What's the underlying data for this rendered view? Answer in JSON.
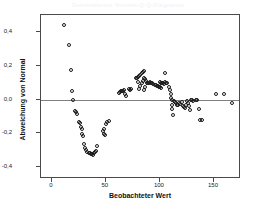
{
  "chart_data": {
    "type": "scatter",
    "title": "Detrendiertes Normal-Q-Q-Diagramm",
    "xlabel": "Beobachteter Wert",
    "ylabel": "Abweichung von Normal",
    "xlim": [
      -10,
      175
    ],
    "ylim": [
      -0.47,
      0.5
    ],
    "xticks": [
      0,
      50,
      100,
      150
    ],
    "xtick_labels": [
      "0",
      "50",
      "100",
      "150"
    ],
    "yticks": [
      0.4,
      0.2,
      0.0,
      -0.2,
      -0.4
    ],
    "ytick_labels": [
      "0,4",
      "0,2",
      "0,0",
      "-0,2",
      "-0,4"
    ],
    "grid": false,
    "legend": false,
    "reference_line_y": 0.0,
    "marker": "open-circle",
    "marker_color": "#1a1a1a",
    "reference_line_color": "#808080",
    "frame_color": "#4a4a4a",
    "points": [
      [
        11,
        0.44
      ],
      [
        16,
        0.32
      ],
      [
        18,
        0.175
      ],
      [
        19,
        0.05
      ],
      [
        20,
        -0.005
      ],
      [
        21,
        -0.065
      ],
      [
        22,
        -0.075
      ],
      [
        23,
        -0.085
      ],
      [
        25,
        -0.135
      ],
      [
        26,
        -0.14
      ],
      [
        27,
        -0.165
      ],
      [
        28,
        -0.175
      ],
      [
        28,
        -0.205
      ],
      [
        29,
        -0.215
      ],
      [
        30,
        -0.265
      ],
      [
        31,
        -0.285
      ],
      [
        32,
        -0.3
      ],
      [
        33,
        -0.31
      ],
      [
        34,
        -0.315
      ],
      [
        35,
        -0.315
      ],
      [
        36,
        -0.32
      ],
      [
        37,
        -0.325
      ],
      [
        38,
        -0.33
      ],
      [
        39,
        -0.315
      ],
      [
        40,
        -0.31
      ],
      [
        41,
        -0.305
      ],
      [
        42,
        -0.275
      ],
      [
        47,
        -0.185
      ],
      [
        48,
        -0.175
      ],
      [
        48,
        -0.205
      ],
      [
        49,
        -0.21
      ],
      [
        50,
        -0.145
      ],
      [
        51,
        -0.135
      ],
      [
        53,
        -0.125
      ],
      [
        62,
        0.04
      ],
      [
        63,
        0.045
      ],
      [
        64,
        0.048
      ],
      [
        65,
        0.05
      ],
      [
        66,
        0.052
      ],
      [
        67,
        0.055
      ],
      [
        68,
        0.035
      ],
      [
        69,
        0.02
      ],
      [
        71,
        0.06
      ],
      [
        72,
        0.058
      ],
      [
        73,
        0.062
      ],
      [
        78,
        0.13
      ],
      [
        79,
        0.125
      ],
      [
        80,
        0.135
      ],
      [
        80,
        0.105
      ],
      [
        81,
        0.14
      ],
      [
        81,
        0.06
      ],
      [
        82,
        0.145
      ],
      [
        82,
        0.08
      ],
      [
        83,
        0.155
      ],
      [
        83,
        0.095
      ],
      [
        84,
        0.165
      ],
      [
        84,
        0.11
      ],
      [
        85,
        0.17
      ],
      [
        85,
        0.13
      ],
      [
        85,
        0.055
      ],
      [
        86,
        0.12
      ],
      [
        86,
        0.075
      ],
      [
        87,
        0.11
      ],
      [
        88,
        0.1
      ],
      [
        89,
        0.095
      ],
      [
        90,
        0.1
      ],
      [
        91,
        0.105
      ],
      [
        92,
        0.1
      ],
      [
        93,
        0.095
      ],
      [
        94,
        0.09
      ],
      [
        95,
        0.088
      ],
      [
        96,
        0.085
      ],
      [
        97,
        0.082
      ],
      [
        98,
        0.078
      ],
      [
        99,
        0.075
      ],
      [
        100,
        0.105
      ],
      [
        100,
        0.072
      ],
      [
        101,
        0.1
      ],
      [
        101,
        0.07
      ],
      [
        102,
        0.098
      ],
      [
        103,
        0.095
      ],
      [
        104,
        0.09
      ],
      [
        105,
        0.155
      ],
      [
        105,
        0.105
      ],
      [
        106,
        0.1
      ],
      [
        107,
        0.095
      ],
      [
        108,
        0.075
      ],
      [
        109,
        0.055
      ],
      [
        110,
        0.03
      ],
      [
        110,
        0.01
      ],
      [
        111,
        -0.005
      ],
      [
        111,
        -0.03
      ],
      [
        111,
        -0.055
      ],
      [
        112,
        -0.09
      ],
      [
        113,
        -0.01
      ],
      [
        114,
        -0.015
      ],
      [
        115,
        -0.02
      ],
      [
        116,
        -0.035
      ],
      [
        117,
        -0.03
      ],
      [
        118,
        -0.02
      ],
      [
        119,
        -0.025
      ],
      [
        120,
        -0.015
      ],
      [
        121,
        -0.04
      ],
      [
        122,
        -0.045
      ],
      [
        123,
        -0.05
      ],
      [
        124,
        -0.035
      ],
      [
        125,
        -0.01
      ],
      [
        126,
        -0.02
      ],
      [
        127,
        -0.04
      ],
      [
        128,
        -0.06
      ],
      [
        129,
        -0.005
      ],
      [
        130,
        -0.005
      ],
      [
        131,
        -0.01
      ],
      [
        133,
        -0.005
      ],
      [
        134,
        0.0
      ],
      [
        136,
        -0.055
      ],
      [
        137,
        -0.12
      ],
      [
        139,
        -0.12
      ],
      [
        152,
        0.03
      ],
      [
        159,
        0.03
      ],
      [
        167,
        -0.02
      ]
    ]
  }
}
